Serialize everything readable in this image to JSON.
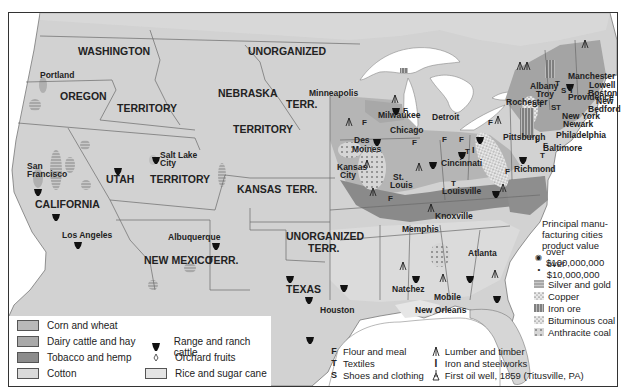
{
  "map": {
    "title": "",
    "territories": [
      {
        "label": "WASHINGTON",
        "x": 78,
        "y": 55
      },
      {
        "label": "OREGON",
        "x": 60,
        "y": 100
      },
      {
        "label": "TERRITORY",
        "x": 117,
        "y": 112
      },
      {
        "label": "UNORGANIZED",
        "x": 248,
        "y": 55
      },
      {
        "label": "NEBRASKA",
        "x": 218,
        "y": 97
      },
      {
        "label": "TERR.",
        "x": 286,
        "y": 108
      },
      {
        "label": "TERRITORY",
        "x": 233,
        "y": 133
      },
      {
        "label": "UTAH",
        "x": 106,
        "y": 183
      },
      {
        "label": "TERRITORY",
        "x": 150,
        "y": 183
      },
      {
        "label": "KANSAS",
        "x": 237,
        "y": 193
      },
      {
        "label": "TERR.",
        "x": 286,
        "y": 193
      },
      {
        "label": "CALIFORNIA",
        "x": 35,
        "y": 208
      },
      {
        "label": "UNORGANIZED",
        "x": 286,
        "y": 240
      },
      {
        "label": "TERR.",
        "x": 308,
        "y": 252
      },
      {
        "label": "NEW MEXICO",
        "x": 144,
        "y": 264
      },
      {
        "label": "TERR.",
        "x": 207,
        "y": 264
      },
      {
        "label": "TEXAS",
        "x": 286,
        "y": 293
      }
    ],
    "cities": [
      {
        "label": "Portland",
        "x": 40,
        "y": 78
      },
      {
        "label": "San",
        "x": 27,
        "y": 169
      },
      {
        "label": "Francisco",
        "x": 27,
        "y": 177
      },
      {
        "label": "Salt Lake",
        "x": 160,
        "y": 158
      },
      {
        "label": "City",
        "x": 160,
        "y": 166
      },
      {
        "label": "Los Angeles",
        "x": 62,
        "y": 238
      },
      {
        "label": "Albuquerque",
        "x": 168,
        "y": 240
      },
      {
        "label": "Minneapolis",
        "x": 309,
        "y": 96
      },
      {
        "label": "Milwaukee",
        "x": 378,
        "y": 118
      },
      {
        "label": "Detroit",
        "x": 432,
        "y": 120
      },
      {
        "label": "Chicago",
        "x": 390,
        "y": 133
      },
      {
        "label": "Des",
        "x": 354,
        "y": 143
      },
      {
        "label": "Moines",
        "x": 352,
        "y": 152
      },
      {
        "label": "Kansas",
        "x": 337,
        "y": 170
      },
      {
        "label": "City",
        "x": 340,
        "y": 178
      },
      {
        "label": "St.",
        "x": 393,
        "y": 180
      },
      {
        "label": "Louis",
        "x": 390,
        "y": 188
      },
      {
        "label": "Cincinnati",
        "x": 441,
        "y": 166
      },
      {
        "label": "Louisville",
        "x": 442,
        "y": 194
      },
      {
        "label": "Knoxville",
        "x": 435,
        "y": 219
      },
      {
        "label": "Memphis",
        "x": 402,
        "y": 232
      },
      {
        "label": "Atlanta",
        "x": 468,
        "y": 256
      },
      {
        "label": "Natchez",
        "x": 392,
        "y": 292
      },
      {
        "label": "Mobile",
        "x": 434,
        "y": 300
      },
      {
        "label": "Houston",
        "x": 320,
        "y": 313
      },
      {
        "label": "New Orleans",
        "x": 415,
        "y": 313
      },
      {
        "label": "Pittsburgh",
        "x": 503,
        "y": 140
      },
      {
        "label": "Richmond",
        "x": 514,
        "y": 172
      },
      {
        "label": "Baltimore",
        "x": 543,
        "y": 151
      },
      {
        "label": "Philadelphia",
        "x": 556,
        "y": 138
      },
      {
        "label": "Newark",
        "x": 563,
        "y": 127
      },
      {
        "label": "New York",
        "x": 562,
        "y": 119
      },
      {
        "label": "Rochester",
        "x": 506,
        "y": 105
      },
      {
        "label": "Albany",
        "x": 530,
        "y": 89
      },
      {
        "label": "Troy",
        "x": 536,
        "y": 97
      },
      {
        "label": "Providence",
        "x": 568,
        "y": 100
      },
      {
        "label": "Manchester",
        "x": 568,
        "y": 79
      },
      {
        "label": "Lowell",
        "x": 589,
        "y": 88
      },
      {
        "label": "Boston",
        "x": 588,
        "y": 96
      },
      {
        "label": "New",
        "x": 596,
        "y": 104
      },
      {
        "label": "Bedford",
        "x": 588,
        "y": 112
      }
    ]
  },
  "legend_crops": {
    "items": [
      {
        "label": "Corn and wheat",
        "color": "#b9b9b9"
      },
      {
        "label": "Dairy cattle and hay",
        "color": "#a9a9a9"
      },
      {
        "label": "Tobacco and hemp",
        "color": "#8c8c8c"
      },
      {
        "label": "Cotton",
        "color": "#dadada"
      }
    ],
    "items_right": [
      {
        "label": "Range and ranch cattle",
        "icon": "cattle-icon"
      },
      {
        "label": "Orchard fruits",
        "icon": "orchard-icon"
      },
      {
        "label": "Rice and sugar cane",
        "color": "#e4e4e4"
      }
    ]
  },
  "legend_cities": {
    "heading_lines": [
      "Principal manu-",
      "facturing cities",
      "product value"
    ],
    "sizes": [
      {
        "label": "over $100,000,000",
        "icon": "large-city-icon"
      },
      {
        "label": "over  $10,000,000",
        "icon": "small-city-icon"
      }
    ],
    "minerals": [
      {
        "label": "Silver and gold",
        "pattern": "horizontal-lines"
      },
      {
        "label": "Copper",
        "pattern": "dots-light"
      },
      {
        "label": "Iron ore",
        "pattern": "vertical-lines"
      },
      {
        "label": "Bituminous coal",
        "pattern": "dots-fine"
      },
      {
        "label": "Anthracite coal",
        "pattern": "dots-coarse"
      }
    ]
  },
  "legend_industry": {
    "items": [
      {
        "symbol": "F",
        "label": "Flour and meal"
      },
      {
        "symbol": "T",
        "label": "Textiles"
      },
      {
        "symbol": "S",
        "label": "Shoes and clothing"
      }
    ],
    "items_right": [
      {
        "symbol": "lumber-icon",
        "label": "Lumber and timber"
      },
      {
        "symbol": "I",
        "label": "Iron and steelworks"
      },
      {
        "symbol": "oil-well-icon",
        "label": "First oil well, 1859 (Titusville, PA)"
      }
    ]
  },
  "colors": {
    "land": "#d2d2d2",
    "water": "#ffffff",
    "corn": "#b9b9b9",
    "dairy": "#a9a9a9",
    "tobacco": "#8c8c8c",
    "cotton": "#dadada",
    "border": "#6a6a6a"
  }
}
